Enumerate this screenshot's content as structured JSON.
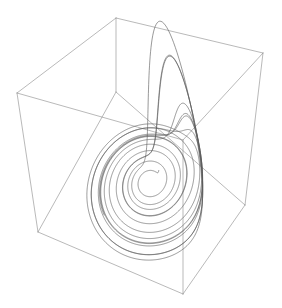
{
  "figure": {
    "title": "",
    "width": 282,
    "height": 308,
    "background_color": "#ffffff",
    "plot_type": "3d-line"
  },
  "chart_data": {
    "type": "line",
    "title": "",
    "subtitle": "",
    "xlabel": "",
    "ylabel": "",
    "zlabel": "",
    "grid": false,
    "legend": null,
    "legend_position": "none",
    "projection": "3d",
    "system": "rossler",
    "parameters": {
      "a": 0.2,
      "b": 0.2,
      "c": 5.7
    },
    "initial_state": {
      "x": 1.0,
      "y": 1.0,
      "z": 1.0
    },
    "integration": {
      "dt": 0.012,
      "steps": 7200,
      "skip": 0
    },
    "xlim": [
      -11.5,
      13.0
    ],
    "ylim": [
      -12.5,
      9.5
    ],
    "zlim": [
      0.0,
      19.0
    ],
    "line_color": "#5a5a5a",
    "line_width": 0.62,
    "box_color": "#8a8a8a",
    "box_line_width": 0.6,
    "view": {
      "elevation": 24,
      "azimuth": -58
    },
    "box_corners_px": {
      "top_back": [
        116,
        18
      ],
      "top_left": [
        17,
        93
      ],
      "top_right": [
        263,
        53
      ],
      "top_front": [
        183,
        140
      ],
      "bottom_back": [
        116,
        92
      ],
      "bottom_left": [
        38,
        232
      ],
      "bottom_right": [
        245,
        205
      ],
      "bottom_front": [
        183,
        294
      ]
    }
  },
  "axes": {
    "x_ticks": [],
    "y_ticks": [],
    "z_ticks": [],
    "x_ticklabels": [],
    "y_ticklabels": [],
    "z_ticklabels": []
  },
  "annotations": []
}
